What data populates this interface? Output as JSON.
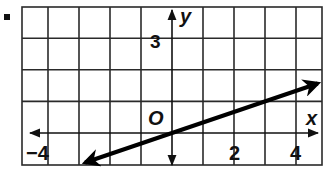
{
  "chart_data": {
    "type": "line",
    "title": "",
    "xlabel": "x",
    "ylabel": "y",
    "origin_label": "O",
    "xlim": [
      -4.8,
      4.8
    ],
    "ylim": [
      -1,
      4
    ],
    "grid": true,
    "grid_step": 1,
    "x_tick_labels": [
      {
        "value": -4,
        "label": "−4"
      },
      {
        "value": 2,
        "label": "2"
      },
      {
        "value": 4,
        "label": "4"
      }
    ],
    "y_tick_labels": [
      {
        "value": 3,
        "label": "3"
      }
    ],
    "series": [
      {
        "name": "line",
        "equation": "y = x/3",
        "slope": 0.3333,
        "intercept": 0,
        "x": [
          -2.8,
          0,
          3,
          4.7
        ],
        "y": [
          -0.93,
          0,
          1,
          1.57
        ],
        "arrows": "both",
        "color": "#000000"
      }
    ],
    "legend": null
  },
  "bullet": "■"
}
